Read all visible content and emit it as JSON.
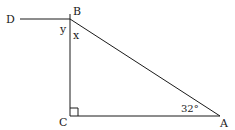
{
  "diagram": {
    "type": "geometry",
    "points": {
      "D": {
        "label": "D",
        "x": 20,
        "y": 19
      },
      "B": {
        "label": "B",
        "x": 70,
        "y": 19
      },
      "C": {
        "label": "C",
        "x": 70,
        "y": 116
      },
      "A": {
        "label": "A",
        "x": 220,
        "y": 116
      }
    },
    "segments": [
      {
        "from": "D",
        "to": "B"
      },
      {
        "from": "B",
        "to": "C"
      },
      {
        "from": "C",
        "to": "A"
      },
      {
        "from": "A",
        "to": "B"
      }
    ],
    "angle_labels": {
      "y": "y",
      "x": "x",
      "angle_A": "32°"
    },
    "right_angle_at": "C",
    "stroke_color": "#1a1a1a"
  }
}
